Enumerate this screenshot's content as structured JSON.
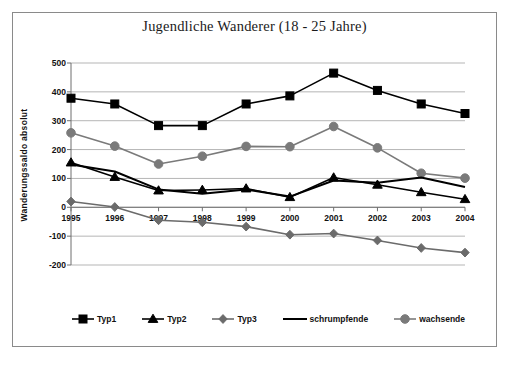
{
  "chart_data": {
    "type": "line",
    "title": "Jugendliche Wanderer (18 - 25 Jahre)",
    "xlabel": "",
    "ylabel": "Wanderungssaldo absolut",
    "categories": [
      "1995",
      "1996",
      "1997",
      "1998",
      "1999",
      "2000",
      "2001",
      "2002",
      "2003",
      "2004"
    ],
    "x": [
      1995,
      1996,
      1997,
      1998,
      1999,
      2000,
      2001,
      2002,
      2003,
      2004
    ],
    "ylim": [
      -200,
      500
    ],
    "yticks": [
      500,
      400,
      300,
      200,
      100,
      0,
      -100,
      -200
    ],
    "ytick_labels": [
      "500",
      "400",
      "300",
      "200",
      "100",
      "0",
      "-100",
      "-200"
    ],
    "grid": "horizontal",
    "legend_position": "bottom",
    "series": [
      {
        "name": "Typ1",
        "marker": "square",
        "color": "#000000",
        "values": [
          378,
          358,
          283,
          283,
          358,
          386,
          465,
          405,
          358,
          325
        ]
      },
      {
        "name": "Typ2",
        "marker": "triangle",
        "color": "#000000",
        "values": [
          155,
          105,
          58,
          60,
          65,
          35,
          103,
          78,
          52,
          28
        ]
      },
      {
        "name": "Typ3",
        "marker": "diamond",
        "color": "#6b6b6b",
        "values": [
          20,
          1,
          -45,
          -52,
          -67,
          -95,
          -91,
          -115,
          -141,
          -157
        ]
      },
      {
        "name": "schrumpfende",
        "marker": "none",
        "color": "#000000",
        "values": [
          148,
          124,
          62,
          47,
          62,
          37,
          93,
          85,
          103,
          70
        ]
      },
      {
        "name": "wachsende",
        "marker": "circle",
        "color": "#7a7a7a",
        "values": [
          258,
          212,
          150,
          177,
          211,
          210,
          280,
          206,
          118,
          101
        ]
      }
    ]
  },
  "legend": {
    "items": [
      {
        "label": "Typ1"
      },
      {
        "label": "Typ2"
      },
      {
        "label": "Typ3"
      },
      {
        "label": "schrumpfende"
      },
      {
        "label": "wachsende"
      }
    ]
  },
  "colors": {
    "frame_border": "#8a8a8a",
    "gridline": "#b5b5b5",
    "axis": "#6f6f6f",
    "background": "#ffffff",
    "text": "#111111"
  }
}
